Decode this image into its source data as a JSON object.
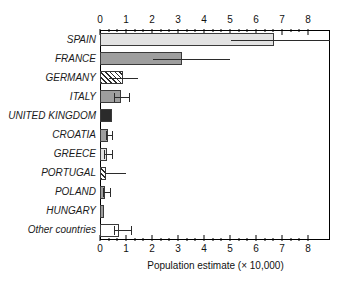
{
  "chart_data": {
    "type": "bar",
    "orientation": "horizontal",
    "title": "",
    "xlabel": "Population estimate (× 10,000)",
    "ylabel": "",
    "xlim": [
      0,
      8.85
    ],
    "xticks": [
      0,
      1,
      2,
      3,
      4,
      5,
      6,
      7,
      8
    ],
    "xtick_labels": [
      "0",
      "1",
      "2",
      "3",
      "4",
      "5",
      "6",
      "7",
      "8"
    ],
    "minor_ticks_per_interval": 2,
    "axes": [
      "top",
      "bottom"
    ],
    "grid": false,
    "legend": null,
    "categories": [
      "SPAIN",
      "FRANCE",
      "GERMANY",
      "ITALY",
      "UNITED KINGDOM",
      "CROATIA",
      "GREECE",
      "PORTUGAL",
      "POLAND",
      "HUNGARY",
      "Other countries"
    ],
    "values": [
      6.7,
      3.15,
      0.9,
      0.82,
      0.45,
      0.32,
      0.28,
      0.25,
      0.18,
      0.15,
      0.75
    ],
    "error_low": [
      5.05,
      2.05,
      0.35,
      0.55,
      null,
      0.22,
      0.15,
      0.2,
      0.12,
      null,
      0.55
    ],
    "error_high": [
      8.85,
      5.0,
      1.45,
      1.12,
      null,
      0.48,
      0.45,
      1.0,
      0.38,
      null,
      1.2
    ],
    "error_caps": [
      false,
      false,
      false,
      true,
      false,
      true,
      true,
      false,
      true,
      false,
      true
    ],
    "bar_styles": [
      "light-gray",
      "mid-gray",
      "hatched",
      "mid-gray",
      "dark",
      "mid-gray",
      "light-gray",
      "hatched",
      "mid-gray",
      "mid-gray",
      "white"
    ],
    "colors": {
      "light-gray": "#e2e2e2",
      "mid-gray": "#9e9e9e",
      "dark": "#2b2b2b",
      "white": "#ffffff",
      "hatched": "#f2f2f2",
      "outline": "#3a3a3a",
      "axis": "#000000",
      "text": "#111111",
      "background": "#ffffff"
    }
  }
}
